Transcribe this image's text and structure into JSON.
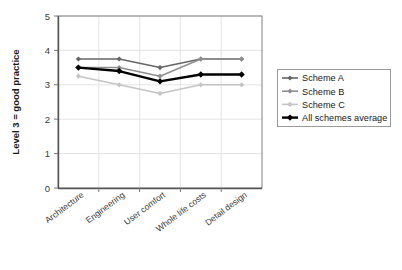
{
  "chart_data": {
    "type": "line",
    "title": "",
    "xlabel": "",
    "ylabel": "Level 3 = good practice",
    "ylim": [
      0,
      5
    ],
    "yticks": [
      "0",
      "1",
      "2",
      "3",
      "4",
      "5"
    ],
    "grid": true,
    "legend_position": "right",
    "categories": [
      "Architecture",
      "Engineering",
      "User comfort",
      "Whole life costs",
      "Detail design"
    ],
    "series": [
      {
        "name": "Scheme A",
        "color": "#666666",
        "values": [
          3.75,
          3.75,
          3.5,
          3.75,
          3.75
        ]
      },
      {
        "name": "Scheme B",
        "color": "#8f8f8f",
        "values": [
          3.5,
          3.5,
          3.25,
          3.75,
          3.75
        ]
      },
      {
        "name": "Scheme C",
        "color": "#c4c4c4",
        "values": [
          3.25,
          3.0,
          2.75,
          3.0,
          3.0
        ]
      },
      {
        "name": "All schemes average",
        "color": "#000000",
        "values": [
          3.5,
          3.4,
          3.1,
          3.3,
          3.3
        ]
      }
    ]
  },
  "legend": {
    "entries": [
      {
        "label": "Scheme A"
      },
      {
        "label": "Scheme B"
      },
      {
        "label": "Scheme C"
      },
      {
        "label": "All schemes average"
      }
    ]
  }
}
